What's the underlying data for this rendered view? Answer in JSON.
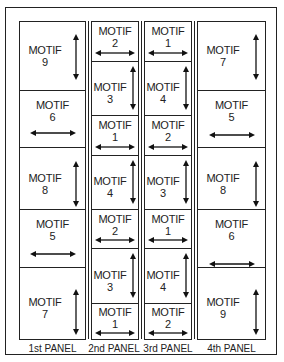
{
  "diagram": {
    "motif_word": "MOTIF",
    "panels": [
      {
        "label": "1st PANEL",
        "cells": [
          {
            "motif": "9",
            "arrow": "vertical"
          },
          {
            "motif": "6",
            "arrow": "horizontal"
          },
          {
            "motif": "8",
            "arrow": "vertical"
          },
          {
            "motif": "5",
            "arrow": "horizontal"
          },
          {
            "motif": "7",
            "arrow": "vertical"
          }
        ]
      },
      {
        "label": "2nd PANEL",
        "cells": [
          {
            "motif": "2",
            "arrow": "horizontal"
          },
          {
            "motif": "3",
            "arrow": "vertical"
          },
          {
            "motif": "1",
            "arrow": "horizontal"
          },
          {
            "motif": "4",
            "arrow": "vertical"
          },
          {
            "motif": "2",
            "arrow": "horizontal"
          },
          {
            "motif": "3",
            "arrow": "vertical"
          },
          {
            "motif": "1",
            "arrow": "horizontal"
          }
        ]
      },
      {
        "label": "3rd PANEL",
        "cells": [
          {
            "motif": "1",
            "arrow": "horizontal"
          },
          {
            "motif": "4",
            "arrow": "vertical"
          },
          {
            "motif": "2",
            "arrow": "horizontal"
          },
          {
            "motif": "3",
            "arrow": "vertical"
          },
          {
            "motif": "1",
            "arrow": "horizontal"
          },
          {
            "motif": "4",
            "arrow": "vertical"
          },
          {
            "motif": "2",
            "arrow": "horizontal"
          }
        ]
      },
      {
        "label": "4th PANEL",
        "cells": [
          {
            "motif": "7",
            "arrow": "vertical"
          },
          {
            "motif": "5",
            "arrow": "horizontal"
          },
          {
            "motif": "8",
            "arrow": "vertical"
          },
          {
            "motif": "6",
            "arrow": "horizontal"
          },
          {
            "motif": "9",
            "arrow": "vertical"
          }
        ]
      }
    ]
  }
}
